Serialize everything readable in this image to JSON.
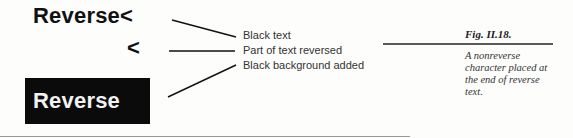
{
  "figure": {
    "samples": {
      "top_text": "Reverse<",
      "middle_text": "<",
      "reversed_box_text": "Reverse"
    },
    "labels": [
      "Black text",
      "Part of text reversed",
      "Black background added"
    ],
    "caption": {
      "figure_number": "Fig. II.18.",
      "lines": [
        "A nonreverse",
        "character placed at",
        "the end of reverse",
        "text."
      ]
    },
    "colors": {
      "ink": "#111111",
      "reverse_background": "#0b0b0b",
      "reverse_text": "#f2f2f2",
      "paper": "#fdfdfc"
    }
  }
}
